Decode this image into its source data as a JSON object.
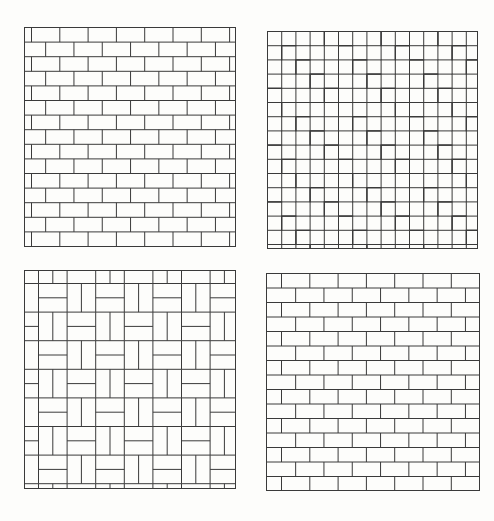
{
  "figure": {
    "background": "#fdfdfb",
    "line_color": "#3a3a3a",
    "panels": [
      {
        "id": "stretcher-bond-a",
        "pattern": "running",
        "x": 24,
        "y": 27,
        "w": 211,
        "h": 219,
        "brick_w": 28.3,
        "row_h": 14.6,
        "start_offset": 7,
        "row_shift": 14.15
      },
      {
        "id": "herringbone",
        "pattern": "herringbone",
        "x": 267,
        "y": 31,
        "w": 210,
        "h": 217,
        "unit": 14.2
      },
      {
        "id": "basketweave",
        "pattern": "basket",
        "x": 24,
        "y": 270,
        "w": 211,
        "h": 218,
        "cell": 28.6,
        "offset_x": 14,
        "offset_y": 13
      },
      {
        "id": "stretcher-bond-b",
        "pattern": "running",
        "x": 266,
        "y": 273,
        "w": 213,
        "h": 217,
        "brick_w": 28.3,
        "row_h": 14.5,
        "start_offset": 15,
        "row_shift": 14.15
      }
    ]
  }
}
